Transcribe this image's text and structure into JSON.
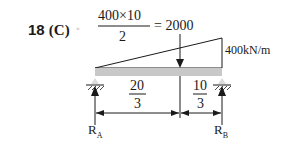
{
  "question": {
    "number": "18",
    "option": "(C)",
    "marker": "◦"
  },
  "equation": {
    "numerator": "400×10",
    "denominator": "2",
    "result": "= 2000"
  },
  "load": {
    "intensity_label": "400kN/m"
  },
  "dimensions": {
    "left": {
      "numerator": "20",
      "denominator": "3"
    },
    "right": {
      "numerator": "10",
      "denominator": "3"
    }
  },
  "reactions": {
    "left": {
      "symbol": "R",
      "subscript": "A"
    },
    "right": {
      "symbol": "R",
      "subscript": "B"
    }
  },
  "colors": {
    "beam": "#c8c8c8",
    "line": "#1a1a1a"
  }
}
